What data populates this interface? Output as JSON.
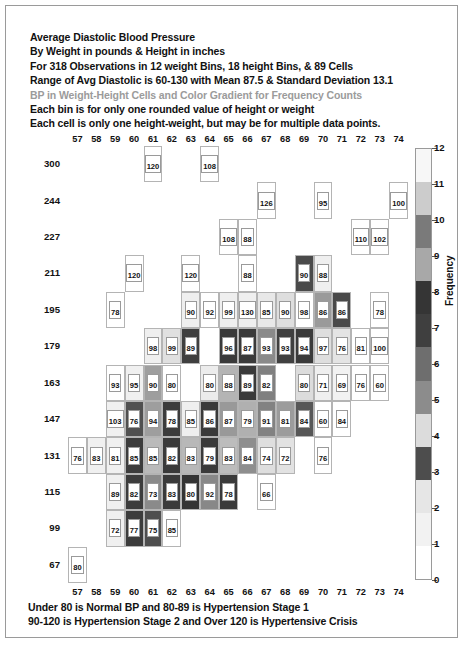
{
  "title_lines": [
    "Average Diastolic Blood Pressure",
    "By Weight in pounds & Height in inches",
    "For 318 Observations in 12 weight Bins, 18 height Bins, & 89 Cells",
    "Range of Avg Diastolic is 60-130 with Mean 87.5 & Standard Deviation 13.1",
    "BP in Weight-Height Cells and Color Gradient for Frequency Counts",
    "Each bin is for only one rounded value of height or weight",
    "Each cell is only one height-weight, but may be for multiple data points."
  ],
  "title_grey_index": 4,
  "footer_lines": [
    "Under 80 is Normal BP and 80-89 is Hypertension Stage 1",
    "90-120 is Hypertension Stage 2 and Over 120 is Hypertensive Crisis"
  ],
  "chart_data": {
    "type": "heatmap",
    "title": "Average Diastolic Blood Pressure",
    "xlabel": "Height in inches",
    "ylabel": "Weight in pounds",
    "x_categories": [
      57,
      58,
      59,
      60,
      61,
      62,
      63,
      64,
      65,
      66,
      67,
      68,
      69,
      70,
      71,
      72,
      73,
      74
    ],
    "y_categories": [
      300,
      244,
      227,
      211,
      195,
      179,
      163,
      147,
      131,
      115,
      99,
      67
    ],
    "cell_value_label": "Average Diastolic BP",
    "cell_color_label": "Frequency",
    "colorbar": {
      "label": "Frequency",
      "ticks": [
        0,
        1,
        2,
        3,
        4,
        5,
        6,
        7,
        8,
        9,
        10,
        11,
        12
      ],
      "min": 0,
      "max": 12,
      "swatches": [
        {
          "value": 0,
          "color": "#ffffff"
        },
        {
          "value": 1,
          "color": "#f2f2f2"
        },
        {
          "value": 2,
          "color": "#e6e6e6"
        },
        {
          "value": 3,
          "color": "#4d4d4d"
        },
        {
          "value": 4,
          "color": "#dcdcdc"
        },
        {
          "value": 5,
          "color": "#8c8c8c"
        },
        {
          "value": 6,
          "color": "#6e6e6e"
        },
        {
          "value": 7,
          "color": "#3f3f3f"
        },
        {
          "value": 8,
          "color": "#353535"
        },
        {
          "value": 9,
          "color": "#a8a8a8"
        },
        {
          "value": 10,
          "color": "#7a7a7a"
        },
        {
          "value": 11,
          "color": "#cccccc"
        },
        {
          "value": 12,
          "color": "#f7f7f7"
        }
      ]
    },
    "cells": [
      {
        "w": 300,
        "h": 61,
        "bp": 120,
        "freq": 0,
        "color": "#ffffff"
      },
      {
        "w": 300,
        "h": 64,
        "bp": 108,
        "freq": 0,
        "color": "#ffffff"
      },
      {
        "w": 244,
        "h": 67,
        "bp": 126,
        "freq": 0,
        "color": "#ffffff"
      },
      {
        "w": 244,
        "h": 70,
        "bp": 95,
        "freq": 0,
        "color": "#ffffff"
      },
      {
        "w": 244,
        "h": 74,
        "bp": 100,
        "freq": 0,
        "color": "#ffffff"
      },
      {
        "w": 227,
        "h": 65,
        "bp": 108,
        "freq": 0,
        "color": "#ffffff"
      },
      {
        "w": 227,
        "h": 66,
        "bp": 88,
        "freq": 0,
        "color": "#ffffff"
      },
      {
        "w": 227,
        "h": 72,
        "bp": 110,
        "freq": 0,
        "color": "#ffffff"
      },
      {
        "w": 227,
        "h": 73,
        "bp": 102,
        "freq": 0,
        "color": "#ffffff"
      },
      {
        "w": 211,
        "h": 60,
        "bp": 120,
        "freq": 0,
        "color": "#ffffff"
      },
      {
        "w": 211,
        "h": 63,
        "bp": 120,
        "freq": 0,
        "color": "#ffffff"
      },
      {
        "w": 211,
        "h": 66,
        "bp": 88,
        "freq": 0,
        "color": "#ffffff"
      },
      {
        "w": 211,
        "h": 69,
        "bp": 90,
        "freq": 8,
        "color": "#4a4a4a"
      },
      {
        "w": 211,
        "h": 70,
        "bp": 88,
        "freq": 1,
        "color": "#efefef"
      },
      {
        "w": 195,
        "h": 59,
        "bp": 78,
        "freq": 0,
        "color": "#ffffff"
      },
      {
        "w": 195,
        "h": 63,
        "bp": 90,
        "freq": 1,
        "color": "#efefef"
      },
      {
        "w": 195,
        "h": 64,
        "bp": 92,
        "freq": 0,
        "color": "#ffffff"
      },
      {
        "w": 195,
        "h": 65,
        "bp": 99,
        "freq": 1,
        "color": "#efefef"
      },
      {
        "w": 195,
        "h": 66,
        "bp": 130,
        "freq": 1,
        "color": "#efefef"
      },
      {
        "w": 195,
        "h": 67,
        "bp": 85,
        "freq": 1,
        "color": "#e8e8e8"
      },
      {
        "w": 195,
        "h": 68,
        "bp": 90,
        "freq": 2,
        "color": "#dedede"
      },
      {
        "w": 195,
        "h": 69,
        "bp": 98,
        "freq": 0,
        "color": "#ffffff"
      },
      {
        "w": 195,
        "h": 70,
        "bp": 86,
        "freq": 5,
        "color": "#9a9a9a"
      },
      {
        "w": 195,
        "h": 71,
        "bp": 86,
        "freq": 7,
        "color": "#4a4a4a"
      },
      {
        "w": 195,
        "h": 73,
        "bp": 78,
        "freq": 0,
        "color": "#ffffff"
      },
      {
        "w": 179,
        "h": 61,
        "bp": 98,
        "freq": 1,
        "color": "#efefef"
      },
      {
        "w": 179,
        "h": 62,
        "bp": 99,
        "freq": 2,
        "color": "#e0e0e0"
      },
      {
        "w": 179,
        "h": 63,
        "bp": 89,
        "freq": 8,
        "color": "#3f3f3f"
      },
      {
        "w": 179,
        "h": 65,
        "bp": 96,
        "freq": 8,
        "color": "#3a3a3a"
      },
      {
        "w": 179,
        "h": 66,
        "bp": 87,
        "freq": 8,
        "color": "#3a3a3a"
      },
      {
        "w": 179,
        "h": 67,
        "bp": 93,
        "freq": 6,
        "color": "#8a8a8a"
      },
      {
        "w": 179,
        "h": 68,
        "bp": 93,
        "freq": 8,
        "color": "#404040"
      },
      {
        "w": 179,
        "h": 69,
        "bp": 94,
        "freq": 8,
        "color": "#3a3a3a"
      },
      {
        "w": 179,
        "h": 70,
        "bp": 97,
        "freq": 2,
        "color": "#dedede"
      },
      {
        "w": 179,
        "h": 71,
        "bp": 76,
        "freq": 2,
        "color": "#e4e4e4"
      },
      {
        "w": 179,
        "h": 72,
        "bp": 81,
        "freq": 0,
        "color": "#ffffff"
      },
      {
        "w": 179,
        "h": 73,
        "bp": 100,
        "freq": 0,
        "color": "#ffffff"
      },
      {
        "w": 163,
        "h": 59,
        "bp": 93,
        "freq": 0,
        "color": "#ffffff"
      },
      {
        "w": 163,
        "h": 60,
        "bp": 95,
        "freq": 1,
        "color": "#f0f0f0"
      },
      {
        "w": 163,
        "h": 61,
        "bp": 90,
        "freq": 5,
        "color": "#9e9e9e"
      },
      {
        "w": 163,
        "h": 62,
        "bp": 80,
        "freq": 0,
        "color": "#ffffff"
      },
      {
        "w": 163,
        "h": 64,
        "bp": 80,
        "freq": 1,
        "color": "#ececec"
      },
      {
        "w": 163,
        "h": 65,
        "bp": 88,
        "freq": 4,
        "color": "#b4b4b4"
      },
      {
        "w": 163,
        "h": 66,
        "bp": 89,
        "freq": 9,
        "color": "#3a3a3a"
      },
      {
        "w": 163,
        "h": 67,
        "bp": 82,
        "freq": 6,
        "color": "#808080"
      },
      {
        "w": 163,
        "h": 69,
        "bp": 80,
        "freq": 2,
        "color": "#dcdcdc"
      },
      {
        "w": 163,
        "h": 70,
        "bp": 71,
        "freq": 1,
        "color": "#efefef"
      },
      {
        "w": 163,
        "h": 71,
        "bp": 69,
        "freq": 1,
        "color": "#f2f2f2"
      },
      {
        "w": 163,
        "h": 72,
        "bp": 76,
        "freq": 0,
        "color": "#ffffff"
      },
      {
        "w": 163,
        "h": 73,
        "bp": 60,
        "freq": 0,
        "color": "#ffffff"
      },
      {
        "w": 147,
        "h": 59,
        "bp": 103,
        "freq": 1,
        "color": "#f0f0f0"
      },
      {
        "w": 147,
        "h": 60,
        "bp": 76,
        "freq": 7,
        "color": "#505050"
      },
      {
        "w": 147,
        "h": 61,
        "bp": 94,
        "freq": 5,
        "color": "#9e9e9e"
      },
      {
        "w": 147,
        "h": 62,
        "bp": 78,
        "freq": 8,
        "color": "#3c3c3c"
      },
      {
        "w": 147,
        "h": 63,
        "bp": 85,
        "freq": 1,
        "color": "#efefef"
      },
      {
        "w": 147,
        "h": 64,
        "bp": 86,
        "freq": 8,
        "color": "#3a3a3a"
      },
      {
        "w": 147,
        "h": 65,
        "bp": 87,
        "freq": 5,
        "color": "#999999"
      },
      {
        "w": 147,
        "h": 66,
        "bp": 79,
        "freq": 4,
        "color": "#b0b0b0"
      },
      {
        "w": 147,
        "h": 67,
        "bp": 91,
        "freq": 6,
        "color": "#828282"
      },
      {
        "w": 147,
        "h": 68,
        "bp": 81,
        "freq": 5,
        "color": "#9c9c9c"
      },
      {
        "w": 147,
        "h": 69,
        "bp": 84,
        "freq": 7,
        "color": "#575757"
      },
      {
        "w": 147,
        "h": 70,
        "bp": 60,
        "freq": 0,
        "color": "#ffffff"
      },
      {
        "w": 147,
        "h": 71,
        "bp": 84,
        "freq": 0,
        "color": "#ffffff"
      },
      {
        "w": 131,
        "h": 57,
        "bp": 76,
        "freq": 0,
        "color": "#ffffff"
      },
      {
        "w": 131,
        "h": 58,
        "bp": 83,
        "freq": 1,
        "color": "#f0f0f0"
      },
      {
        "w": 131,
        "h": 59,
        "bp": 81,
        "freq": 1,
        "color": "#f0f0f0"
      },
      {
        "w": 131,
        "h": 60,
        "bp": 85,
        "freq": 8,
        "color": "#3c3c3c"
      },
      {
        "w": 131,
        "h": 61,
        "bp": 85,
        "freq": 4,
        "color": "#bababa"
      },
      {
        "w": 131,
        "h": 62,
        "bp": 82,
        "freq": 8,
        "color": "#3a3a3a"
      },
      {
        "w": 131,
        "h": 63,
        "bp": 83,
        "freq": 4,
        "color": "#b8b8b8"
      },
      {
        "w": 131,
        "h": 64,
        "bp": 79,
        "freq": 8,
        "color": "#3a3a3a"
      },
      {
        "w": 131,
        "h": 65,
        "bp": 83,
        "freq": 4,
        "color": "#bcbcbc"
      },
      {
        "w": 131,
        "h": 66,
        "bp": 84,
        "freq": 6,
        "color": "#8e8e8e"
      },
      {
        "w": 131,
        "h": 67,
        "bp": 74,
        "freq": 2,
        "color": "#dedede"
      },
      {
        "w": 131,
        "h": 68,
        "bp": 72,
        "freq": 2,
        "color": "#e2e2e2"
      },
      {
        "w": 131,
        "h": 70,
        "bp": 76,
        "freq": 0,
        "color": "#ffffff"
      },
      {
        "w": 115,
        "h": 59,
        "bp": 89,
        "freq": 1,
        "color": "#f0f0f0"
      },
      {
        "w": 115,
        "h": 60,
        "bp": 82,
        "freq": 8,
        "color": "#3c3c3c"
      },
      {
        "w": 115,
        "h": 61,
        "bp": 73,
        "freq": 6,
        "color": "#8a8a8a"
      },
      {
        "w": 115,
        "h": 62,
        "bp": 83,
        "freq": 8,
        "color": "#3a3a3a"
      },
      {
        "w": 115,
        "h": 63,
        "bp": 80,
        "freq": 9,
        "color": "#343434"
      },
      {
        "w": 115,
        "h": 64,
        "bp": 92,
        "freq": 6,
        "color": "#888888"
      },
      {
        "w": 115,
        "h": 65,
        "bp": 78,
        "freq": 8,
        "color": "#3a3a3a"
      },
      {
        "w": 115,
        "h": 67,
        "bp": 66,
        "freq": 0,
        "color": "#ffffff"
      },
      {
        "w": 99,
        "h": 59,
        "bp": 72,
        "freq": 1,
        "color": "#f0f0f0"
      },
      {
        "w": 99,
        "h": 60,
        "bp": 77,
        "freq": 8,
        "color": "#3c3c3c"
      },
      {
        "w": 99,
        "h": 61,
        "bp": 75,
        "freq": 7,
        "color": "#4e4e4e"
      },
      {
        "w": 99,
        "h": 62,
        "bp": 85,
        "freq": 0,
        "color": "#ffffff"
      },
      {
        "w": 67,
        "h": 57,
        "bp": 80,
        "freq": 0,
        "color": "#ffffff"
      }
    ]
  }
}
